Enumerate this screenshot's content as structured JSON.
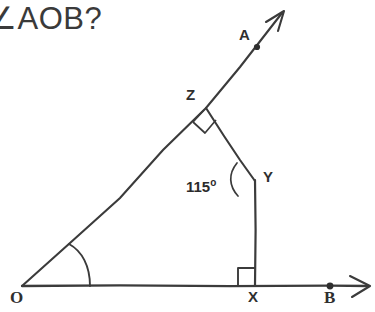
{
  "question": {
    "text": "∠AOB?",
    "note": "partially cropped at left edge"
  },
  "figure": {
    "stroke_color": "#3b3b3b",
    "background": "#ffffff",
    "points": [
      {
        "id": "O",
        "label": "O",
        "x": 22,
        "y": 286,
        "label_x": 10,
        "label_y": 288
      },
      {
        "id": "A",
        "label": "A",
        "x": 257,
        "y": 47,
        "label_x": 239,
        "label_y": 26
      },
      {
        "id": "B",
        "label": "B",
        "x": 330,
        "y": 286,
        "label_x": 324,
        "label_y": 288
      },
      {
        "id": "X",
        "label": "X",
        "x": 255,
        "y": 286,
        "label_x": 248,
        "label_y": 288
      },
      {
        "id": "Y",
        "label": "Y",
        "x": 255,
        "y": 180,
        "label_x": 263,
        "label_y": 168
      },
      {
        "id": "Z",
        "label": "Z",
        "x": 206,
        "y": 108,
        "label_x": 186,
        "label_y": 86
      }
    ],
    "rays": [
      {
        "name": "ray-OA",
        "from": "O",
        "through": "A",
        "tip_x": 284,
        "tip_y": 11,
        "arrow": true
      },
      {
        "name": "ray-OB",
        "from": "O",
        "through": "B",
        "tip_x": 371,
        "tip_y": 286,
        "arrow": true
      }
    ],
    "segments": [
      {
        "name": "segment-ZY",
        "from": "Z",
        "to": "Y"
      },
      {
        "name": "segment-YX",
        "from": "Y",
        "to": "X"
      }
    ],
    "angles": [
      {
        "name": "angle-AOB",
        "vertex": "O",
        "value": "",
        "marker": "arc",
        "unknown": true
      },
      {
        "name": "angle-at-Z",
        "vertex": "Z",
        "value": "90",
        "marker": "right-angle-square"
      },
      {
        "name": "angle-ZYX",
        "vertex": "Y",
        "value": "115",
        "unit": "°",
        "marker": "arc"
      },
      {
        "name": "angle-at-X",
        "vertex": "X",
        "value": "90",
        "marker": "right-angle-square"
      }
    ],
    "angle_label_115": {
      "value": "115",
      "degree": "o",
      "x": 186,
      "y": 177
    }
  }
}
